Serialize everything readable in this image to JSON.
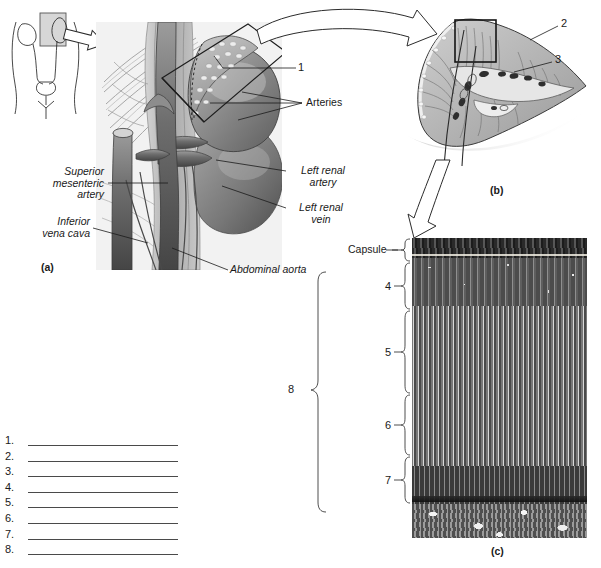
{
  "figure": {
    "panels": [
      {
        "id": "a",
        "label": "(a)"
      },
      {
        "id": "b",
        "label": "(b)"
      },
      {
        "id": "c",
        "label": "(c)"
      }
    ]
  },
  "panel_a": {
    "leader_labels": [
      {
        "name": "number-1",
        "text": "1"
      },
      {
        "name": "arteries",
        "text": "Arteries"
      },
      {
        "name": "superior-mesenteric-artery",
        "text": "Superior\nmesenteric\nartery"
      },
      {
        "name": "inferior-vena-cava",
        "text": "Inferior\nvena cava"
      },
      {
        "name": "left-renal-artery",
        "text": "Left renal\nartery"
      },
      {
        "name": "left-renal-vein",
        "text": "Left renal\nvein"
      },
      {
        "name": "abdominal-aorta",
        "text": "Abdominal aorta"
      }
    ],
    "inset_caption": "(a)"
  },
  "panel_b": {
    "leader_labels": [
      {
        "name": "number-2",
        "text": "2"
      },
      {
        "name": "number-3",
        "text": "3"
      }
    ],
    "caption": "(b)"
  },
  "panel_c": {
    "bracket_labels": [
      {
        "name": "capsule",
        "text": "Capsule"
      },
      {
        "name": "number-4",
        "text": "4"
      },
      {
        "name": "number-5",
        "text": "5"
      },
      {
        "name": "number-6",
        "text": "6"
      },
      {
        "name": "number-7",
        "text": "7"
      }
    ],
    "caption": "(c)"
  },
  "bracket_8": {
    "label": "8"
  },
  "answer_list": {
    "items": [
      {
        "number": "1."
      },
      {
        "number": "2."
      },
      {
        "number": "3."
      },
      {
        "number": "4."
      },
      {
        "number": "5."
      },
      {
        "number": "6."
      },
      {
        "number": "7."
      },
      {
        "number": "8."
      }
    ]
  },
  "colors": {
    "ink": "#1a1a1a",
    "rule": "#4a4a4a",
    "tissue_mid": "#8d8d8d",
    "tissue_dark": "#5a5a5a",
    "paper": "#ffffff"
  }
}
